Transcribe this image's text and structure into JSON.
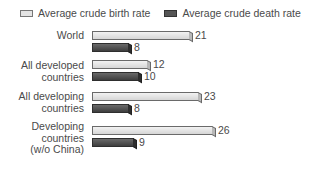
{
  "legend": {
    "birth_label": "Average crude birth rate",
    "death_label": "Average crude death rate"
  },
  "colors": {
    "birth": "#e4e4e4",
    "death": "#555555"
  },
  "categories": [
    {
      "label_lines": [
        "World"
      ],
      "birth": "21",
      "death": "8"
    },
    {
      "label_lines": [
        "All developed",
        "countries"
      ],
      "birth": "12",
      "death": "10"
    },
    {
      "label_lines": [
        "All developing",
        "countries"
      ],
      "birth": "23",
      "death": "8"
    },
    {
      "label_lines": [
        "Developing",
        "countries",
        "(w/o China)"
      ],
      "birth": "26",
      "death": "9"
    }
  ],
  "chart_data": {
    "type": "bar",
    "orientation": "horizontal",
    "title": "",
    "xlabel": "",
    "ylabel": "",
    "categories": [
      "World",
      "All developed countries",
      "All developing countries",
      "Developing countries (w/o China)"
    ],
    "series": [
      {
        "name": "Average crude birth rate",
        "values": [
          21,
          12,
          23,
          26
        ]
      },
      {
        "name": "Average crude death rate",
        "values": [
          8,
          10,
          8,
          9
        ]
      }
    ],
    "legend_position": "top",
    "grid": false,
    "xlim": [
      0,
      28
    ]
  }
}
